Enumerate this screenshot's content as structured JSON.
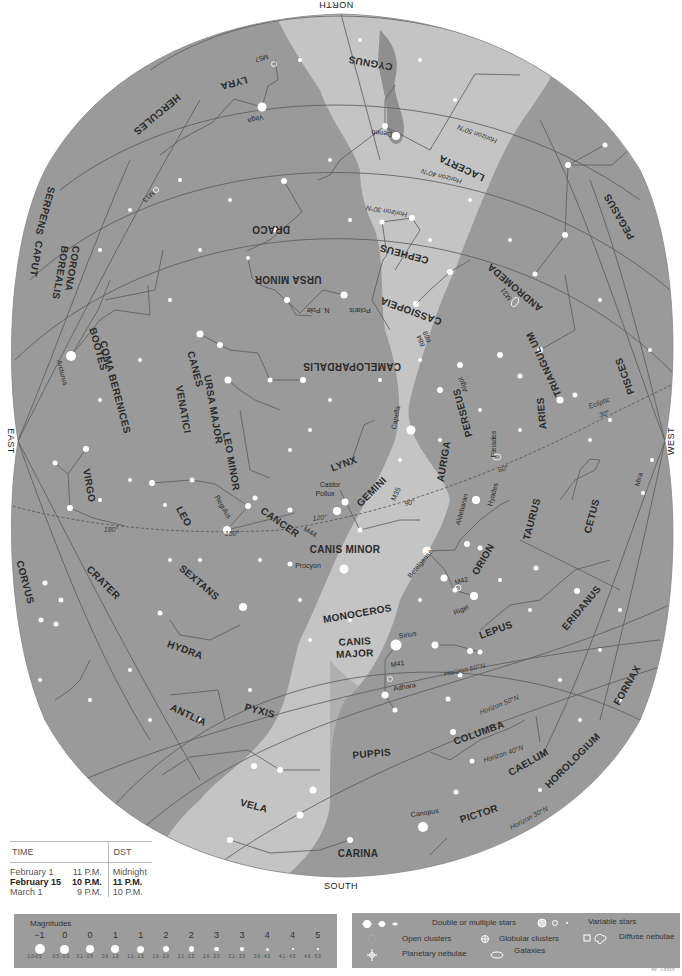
{
  "directions": {
    "north": "NORTH",
    "south": "SOUTH",
    "east": "EAST",
    "west": "WEST"
  },
  "constellations": [
    {
      "name": "CYGNUS",
      "x": 371,
      "y": 60,
      "rot": 190
    },
    {
      "name": "LYRA",
      "x": 233,
      "y": 80,
      "rot": 165
    },
    {
      "name": "HERCULES",
      "x": 155,
      "y": 112,
      "rot": 140
    },
    {
      "name": "LACERTA",
      "x": 463,
      "y": 165,
      "rot": 205
    },
    {
      "name": "PEGASUS",
      "x": 622,
      "y": 215,
      "rot": 240
    },
    {
      "name": "SERPENS",
      "x": 42,
      "y": 210,
      "rot": 105
    },
    {
      "name": "CAPUT",
      "x": 33,
      "y": 258,
      "rot": 100
    },
    {
      "name": "CORONA",
      "x": 69,
      "y": 268,
      "rot": 100
    },
    {
      "name": "BOREALIS",
      "x": 57,
      "y": 272,
      "rot": 100
    },
    {
      "name": "DRACO",
      "x": 271,
      "y": 226,
      "rot": 180
    },
    {
      "name": "CEPHEUS",
      "x": 405,
      "y": 251,
      "rot": 195
    },
    {
      "name": "URSA MINOR",
      "x": 288,
      "y": 276,
      "rot": 180
    },
    {
      "name": "ANDROMEDA",
      "x": 517,
      "y": 285,
      "rot": 220
    },
    {
      "name": "CASSIOPEIA",
      "x": 412,
      "y": 308,
      "rot": 200
    },
    {
      "name": "BOÖTES",
      "x": 95,
      "y": 350,
      "rot": 75
    },
    {
      "name": "COMA BERENICES",
      "x": 112,
      "y": 388,
      "rot": 75
    },
    {
      "name": "CANES",
      "x": 192,
      "y": 370,
      "rot": 75
    },
    {
      "name": "VENATICI",
      "x": 180,
      "y": 410,
      "rot": 80
    },
    {
      "name": "URSA MAJOR",
      "x": 210,
      "y": 410,
      "rot": 80
    },
    {
      "name": "CAMELOPARDALIS",
      "x": 352,
      "y": 363,
      "rot": 180
    },
    {
      "name": "TRIANGULUM",
      "x": 547,
      "y": 363,
      "rot": 245
    },
    {
      "name": "PISCES",
      "x": 628,
      "y": 375,
      "rot": 250
    },
    {
      "name": "PERSEUS",
      "x": 466,
      "y": 412,
      "rot": 255
    },
    {
      "name": "ARIES",
      "x": 545,
      "y": 413,
      "rot": 265
    },
    {
      "name": "LEO MINOR",
      "x": 228,
      "y": 462,
      "rot": 80
    },
    {
      "name": "VIRGO",
      "x": 86,
      "y": 486,
      "rot": 80
    },
    {
      "name": "LYNX",
      "x": 345,
      "y": 467,
      "rot": -20
    },
    {
      "name": "AURIGA",
      "x": 447,
      "y": 462,
      "rot": -80
    },
    {
      "name": "GEMINI",
      "x": 374,
      "y": 494,
      "rot": -45
    },
    {
      "name": "LEO",
      "x": 181,
      "y": 518,
      "rot": 60
    },
    {
      "name": "TAURUS",
      "x": 535,
      "y": 520,
      "rot": -75
    },
    {
      "name": "CETUS",
      "x": 595,
      "y": 517,
      "rot": -75
    },
    {
      "name": "CANCER",
      "x": 278,
      "y": 525,
      "rot": 35
    },
    {
      "name": "CANIS MINOR",
      "x": 345,
      "y": 553,
      "rot": 0
    },
    {
      "name": "ORION",
      "x": 486,
      "y": 561,
      "rot": -60
    },
    {
      "name": "CORVUS",
      "x": 22,
      "y": 583,
      "rot": 75
    },
    {
      "name": "CRATER",
      "x": 101,
      "y": 585,
      "rot": 45
    },
    {
      "name": "SEXTANS",
      "x": 197,
      "y": 585,
      "rot": 40
    },
    {
      "name": "MONOCEROS",
      "x": 358,
      "y": 617,
      "rot": -10
    },
    {
      "name": "ERIDANUS",
      "x": 584,
      "y": 610,
      "rot": -50
    },
    {
      "name": "CANIS",
      "x": 355,
      "y": 645,
      "rot": -3
    },
    {
      "name": "MAJOR",
      "x": 355,
      "y": 657,
      "rot": -3
    },
    {
      "name": "LEPUS",
      "x": 497,
      "y": 633,
      "rot": -20
    },
    {
      "name": "HYDRA",
      "x": 184,
      "y": 653,
      "rot": 20
    },
    {
      "name": "FORNAX",
      "x": 630,
      "y": 687,
      "rot": -60
    },
    {
      "name": "ANTLIA",
      "x": 187,
      "y": 718,
      "rot": 25
    },
    {
      "name": "PYXIS",
      "x": 259,
      "y": 714,
      "rot": 15
    },
    {
      "name": "COLUMBA",
      "x": 480,
      "y": 736,
      "rot": -20
    },
    {
      "name": "PUPPIS",
      "x": 372,
      "y": 757,
      "rot": -5
    },
    {
      "name": "CAELUM",
      "x": 530,
      "y": 765,
      "rot": -30
    },
    {
      "name": "HOROLOGIUM",
      "x": 575,
      "y": 763,
      "rot": -45
    },
    {
      "name": "VELA",
      "x": 253,
      "y": 809,
      "rot": 15
    },
    {
      "name": "PICTOR",
      "x": 480,
      "y": 817,
      "rot": -18
    },
    {
      "name": "CARINA",
      "x": 358,
      "y": 857,
      "rot": 0
    }
  ],
  "stars": [
    {
      "name": "Vega",
      "x": 262,
      "y": 107,
      "lx": 255,
      "ly": 117,
      "rot": 165
    },
    {
      "name": "Deneb",
      "x": 396,
      "y": 136,
      "lx": 382,
      "ly": 131,
      "rot": 185
    },
    {
      "name": "Polaris",
      "x": 344,
      "y": 295,
      "lx": 360,
      "ly": 308,
      "rot": 180
    },
    {
      "name": "N. Pole",
      "x": 0,
      "y": 0,
      "lx": 318,
      "ly": 308,
      "rot": 180
    },
    {
      "name": "Arcturus",
      "x": 71,
      "y": 356,
      "lx": 60,
      "ly": 373,
      "rot": 75
    },
    {
      "name": "Capella",
      "x": 411,
      "y": 430,
      "lx": 398,
      "ly": 418,
      "rot": -80
    },
    {
      "name": "Castor",
      "x": 345,
      "y": 502,
      "lx": 330,
      "ly": 487,
      "rot": 0
    },
    {
      "name": "Pollux",
      "x": 337,
      "y": 511,
      "lx": 325,
      "ly": 496,
      "rot": 0
    },
    {
      "name": "Regulus",
      "x": 227,
      "y": 530,
      "lx": 221,
      "ly": 508,
      "rot": 60
    },
    {
      "name": "Aldebaran",
      "x": 476,
      "y": 500,
      "lx": 464,
      "ly": 510,
      "rot": -75
    },
    {
      "name": "Procyon",
      "x": 344,
      "y": 569,
      "lx": 308,
      "ly": 568,
      "rot": 0
    },
    {
      "name": "Betelgeuse",
      "x": 427,
      "y": 551,
      "lx": 422,
      "ly": 565,
      "rot": -50
    },
    {
      "name": "Rigel",
      "x": 474,
      "y": 596,
      "lx": 462,
      "ly": 612,
      "rot": -25
    },
    {
      "name": "Sirius",
      "x": 396,
      "y": 645,
      "lx": 408,
      "ly": 637,
      "rot": -10
    },
    {
      "name": "Adhara",
      "x": 385,
      "y": 695,
      "lx": 405,
      "ly": 689,
      "rot": -10
    },
    {
      "name": "Canopus",
      "x": 423,
      "y": 827,
      "lx": 425,
      "ly": 815,
      "rot": -8
    },
    {
      "name": "Mira",
      "x": 638,
      "y": 492,
      "lx": 641,
      "ly": 480,
      "rot": -75
    }
  ],
  "deep_sky": [
    {
      "name": "M57",
      "lx": 261,
      "ly": 56,
      "rot": 165
    },
    {
      "name": "M13",
      "lx": 147,
      "ly": 195,
      "rot": 135
    },
    {
      "name": "M31",
      "lx": 508,
      "ly": 293,
      "rot": 235
    },
    {
      "name": "884",
      "lx": 423,
      "ly": 340,
      "rot": 250
    },
    {
      "name": "869",
      "lx": 429,
      "ly": 336,
      "rot": 250
    },
    {
      "name": "Algol",
      "lx": 465,
      "ly": 384,
      "rot": 250
    },
    {
      "name": "Pleiades",
      "lx": 496,
      "ly": 444,
      "rot": -90
    },
    {
      "name": "Hyades",
      "lx": 495,
      "ly": 495,
      "rot": -75
    },
    {
      "name": "M35",
      "lx": 398,
      "ly": 495,
      "rot": -65
    },
    {
      "name": "M44",
      "lx": 309,
      "ly": 534,
      "rot": 30
    },
    {
      "name": "M42",
      "lx": 462,
      "ly": 583,
      "rot": -15
    },
    {
      "name": "M41",
      "lx": 398,
      "ly": 666,
      "rot": -10
    }
  ],
  "horizons": [
    {
      "label": "Horizon 60°N",
      "x": 495,
      "y": 18,
      "rot": 205
    },
    {
      "name": "h50n",
      "label": "Horizon 50°N",
      "x": 478,
      "y": 132,
      "rot": 200
    },
    {
      "label": "Horizon 40°N",
      "x": 442,
      "y": 174,
      "rot": 195
    },
    {
      "label": "Horizon 30°N",
      "x": 387,
      "y": 209,
      "rot": 190
    },
    {
      "label": "Horizon 60°N",
      "x": 465,
      "y": 672,
      "rot": -12
    },
    {
      "label": "Horizon 50°N",
      "x": 500,
      "y": 707,
      "rot": -22
    },
    {
      "label": "Horizon 40°N",
      "x": 504,
      "y": 756,
      "rot": -18
    },
    {
      "label": "Horizon 30°N",
      "x": 530,
      "y": 820,
      "rot": -28
    }
  ],
  "ecliptic": {
    "label": "Ecliptic",
    "marks": [
      {
        "label": "30°",
        "x": 605,
        "y": 416,
        "rot": -20
      },
      {
        "label": "60°",
        "x": 504,
        "y": 471,
        "rot": -20
      },
      {
        "label": "90°",
        "x": 410,
        "y": 505,
        "rot": -10
      },
      {
        "label": "120°",
        "x": 320,
        "y": 520,
        "rot": -5
      },
      {
        "label": "150°",
        "x": 232,
        "y": 536,
        "rot": 0
      },
      {
        "label": "180°",
        "x": 111,
        "y": 532,
        "rot": 0
      }
    ]
  },
  "time_table": {
    "header_time": "TIME",
    "header_dst": "DST",
    "rows": [
      {
        "date": "February 1",
        "time": "11 P.M.",
        "dst": "Midnight",
        "bold": false
      },
      {
        "date": "February 15",
        "time": "10 P.M.",
        "dst": "11 P.M.",
        "bold": true
      },
      {
        "date": "March 1",
        "time": "9 P.M.",
        "dst": "10 P.M.",
        "bold": false
      }
    ]
  },
  "magnitudes": {
    "title": "Magnitudes",
    "scale": [
      {
        "mag": "−1",
        "range": "-1.0-0.5",
        "size": 10
      },
      {
        "mag": "0",
        "range": "-0.5 - 0.0",
        "size": 9
      },
      {
        "mag": "0",
        "range": "0.1 - 0.5",
        "size": 8.5
      },
      {
        "mag": "1",
        "range": "0.6 - 1.0",
        "size": 8
      },
      {
        "mag": "1",
        "range": "1.1 - 1.5",
        "size": 7
      },
      {
        "mag": "2",
        "range": "1.6 - 2.0",
        "size": 6.5
      },
      {
        "mag": "2",
        "range": "2.1 - 2.5",
        "size": 5.5
      },
      {
        "mag": "3",
        "range": "2.6 - 3.0",
        "size": 4.5
      },
      {
        "mag": "3",
        "range": "3.1 - 3.5",
        "size": 3.5
      },
      {
        "mag": "4",
        "range": "3.6 - 4.0",
        "size": 3
      },
      {
        "mag": "4",
        "range": "4.1 - 4.5",
        "size": 2
      },
      {
        "mag": "5",
        "range": "4.6 - 5.0",
        "size": 1.5
      }
    ]
  },
  "legend": {
    "double_stars": "Double or multiple stars",
    "variable_stars": "Variable stars",
    "open_clusters": "Open clusters",
    "globular_clusters": "Globular clusters",
    "diffuse_nebulae": "Diffuse nebulae",
    "planetary_nebulae": "Planetary nebulae",
    "galaxies": "Galaxies"
  },
  "signature": "W. Tirion",
  "colors": {
    "sky": "#9a9a9a",
    "milky_way": "#c4c4c4",
    "milky_way_dark": "#8a8a8a",
    "lines": "#5a5a5a",
    "star": "#ffffff"
  }
}
